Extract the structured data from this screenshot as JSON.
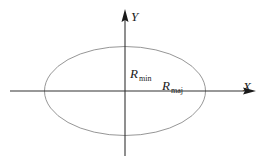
{
  "diagram": {
    "title": "",
    "axes": {
      "x_label": "X",
      "y_label": "Y"
    },
    "annotations": {
      "r_min": {
        "symbol": "R",
        "subscript": "min"
      },
      "r_maj": {
        "symbol": "R",
        "subscript": "maj"
      }
    },
    "colors": {
      "axis": "#333333",
      "ellipse": "#8a8a8a",
      "text": "#1a1a1a",
      "background": "#ffffff"
    },
    "geometry": {
      "center": [
        125,
        91
      ],
      "rx": 80.5,
      "ry": 44.5
    }
  }
}
